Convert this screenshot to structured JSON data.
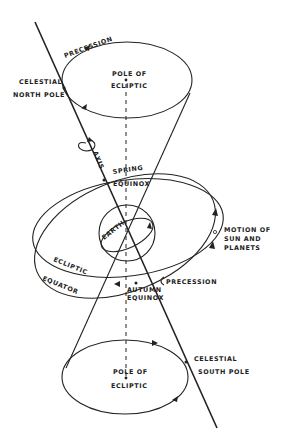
{
  "figure": {
    "labels": {
      "precession_top": "PRECESSION",
      "celestial_north_1": "CELESTIAL",
      "celestial_north_2": "NORTH POLE",
      "pole_ecliptic_top_1": "POLE OF",
      "pole_ecliptic_top_2": "ECLIPTIC",
      "axis": "AXIS",
      "spring_1": "SPRING",
      "spring_2": "EQUINOX",
      "earth": "EARTH",
      "motion_1": "MOTION OF",
      "motion_2": "SUN AND",
      "motion_3": "PLANETS",
      "ecliptic": "ECLIPTIC",
      "equator": "EQUATOR",
      "precession_mid": "PRECESSION",
      "autumn_1": "AUTUMN",
      "autumn_2": "EQUINOX",
      "celestial_south_1": "CELESTIAL",
      "celestial_south_2": "SOUTH POLE",
      "pole_ecliptic_bottom_1": "POLE OF",
      "pole_ecliptic_bottom_2": "ECLIPTIC"
    },
    "colors": {
      "ink": "#222222",
      "background": "#ffffff"
    }
  }
}
